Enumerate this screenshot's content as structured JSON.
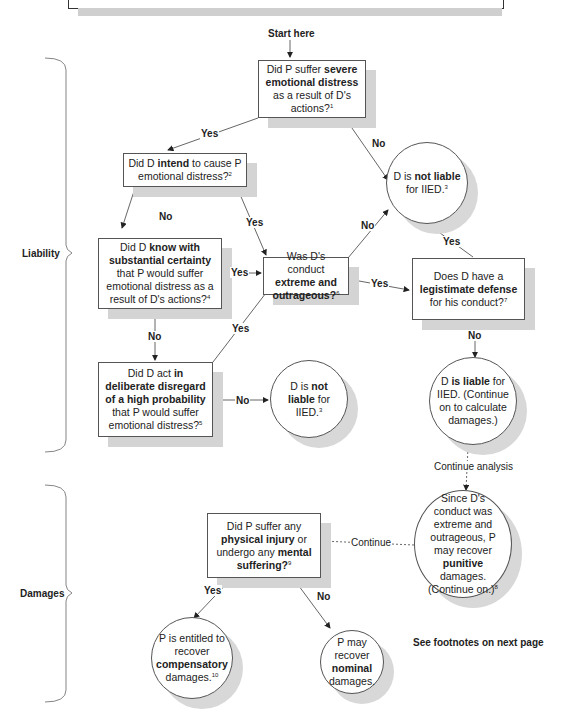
{
  "start_label": "Start here",
  "sections": {
    "liability": "Liability",
    "damages": "Damages"
  },
  "nodes": {
    "q1": {
      "pre": "Did P suffer ",
      "bold": "severe emotional distress",
      "post": " as a result of D's actions?",
      "note": "1"
    },
    "q2": {
      "pre": "Did D ",
      "bold": "intend",
      "post": " to cause P emotional distress?",
      "note": "2"
    },
    "q3": {
      "pre": "Did D ",
      "bold": "know with substantial certainty",
      "post": " that P would suffer emotional distress as a result of D's actions?",
      "note": "4"
    },
    "q4": {
      "pre": "Did D act ",
      "bold": "in deliberate disregard of a high probability",
      "post": " that P would suffer emotional distress?",
      "note": "5"
    },
    "q5": {
      "pre": "Was D's conduct ",
      "bold": "extreme and outrageous?",
      "post": "",
      "note": "6"
    },
    "q6": {
      "pre": "Does D have a ",
      "bold": "legistimate defense",
      "post": " for his conduct?",
      "note": "7"
    },
    "not_liable_top": {
      "pre": "D is ",
      "bold": "not liable",
      "post": " for IIED.",
      "note": "3"
    },
    "not_liable_bottom": {
      "pre": "D is ",
      "bold": "not liable",
      "post": " for IIED.",
      "note": "3"
    },
    "liable": {
      "pre": "D ",
      "bold": "is liable",
      "post": " for IIED. (Continue on to calculate damages.)",
      "note": ""
    },
    "punitive": {
      "pre": "Since D's conduct was extreme and outrageous, P may recover ",
      "bold": "punitive",
      "post": " damages. (Continue on.)",
      "note": "8"
    },
    "q7": {
      "pre": "Did P suffer any ",
      "bold": "physical injury",
      "mid": " or undergo any ",
      "bold2": "mental suffering?",
      "note": "9"
    },
    "compensatory": {
      "pre": "P is entitled to recover ",
      "bold": "compensatory",
      "post": " damages.",
      "note": "10"
    },
    "nominal": {
      "pre": "P may recover ",
      "bold": "nominal",
      "post": " damages.",
      "note": ""
    }
  },
  "edges": {
    "q1_yes": "Yes",
    "q1_no": "No",
    "q2_no": "No",
    "q2_yes": "Yes",
    "q3_yes": "Yes",
    "q3_no": "No",
    "q4_yes": "Yes",
    "q4_no": "No",
    "q5_no": "No",
    "q5_yes": "Yes",
    "q6_yes": "Yes",
    "q6_no": "No",
    "continue_analysis": "Continue analysis",
    "continue": "Continue",
    "q7_yes": "Yes",
    "q7_no": "No"
  },
  "footer_note": "See footnotes on next page"
}
